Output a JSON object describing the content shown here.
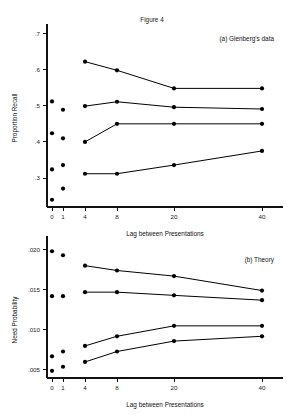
{
  "figure": {
    "title": "Figure 4",
    "xlabel": "Lag between Presentations"
  },
  "chart_data": [
    {
      "type": "line",
      "panel_label": "(a) Glenberg's data",
      "title": "Figure 4",
      "xlabel": "Lag between Presentations",
      "ylabel": "Proportion Recall",
      "x_ticklabels": [
        "0",
        "1",
        "4",
        "8",
        "20",
        "40"
      ],
      "x_values": [
        0,
        1,
        4,
        8,
        20,
        40
      ],
      "y_ticklabels": [
        ".3",
        ".4",
        ".5",
        ".6",
        ".7"
      ],
      "ylim": [
        0.22,
        0.715
      ],
      "grid": false,
      "legend": "none",
      "connected_x": [
        4,
        8,
        20,
        40
      ],
      "series": [
        {
          "name": "series-1-top",
          "values": [
            0.622,
            0.598,
            0.548,
            0.548
          ]
        },
        {
          "name": "series-2",
          "values": [
            0.499,
            0.511,
            0.496,
            0.491
          ]
        },
        {
          "name": "series-3",
          "values": [
            0.4,
            0.45,
            0.45,
            0.45
          ]
        },
        {
          "name": "series-4-bottom",
          "values": [
            0.312,
            0.312,
            0.336,
            0.375
          ]
        }
      ],
      "isolated_points": [
        {
          "x": 0,
          "values": [
            0.512,
            0.424,
            0.324,
            0.24
          ]
        },
        {
          "x": 1,
          "values": [
            0.489,
            0.41,
            0.336,
            0.271
          ]
        }
      ]
    },
    {
      "type": "line",
      "panel_label": "(b) Theory",
      "xlabel": "Lag between Presentations",
      "ylabel": "Need Probability",
      "x_ticklabels": [
        "0",
        "1",
        "4",
        "8",
        "20",
        "40"
      ],
      "x_values": [
        0,
        1,
        4,
        8,
        20,
        40
      ],
      "y_ticklabels": [
        ".005",
        ".010",
        ".015",
        ".020"
      ],
      "ylim": [
        0.004,
        0.0212
      ],
      "grid": false,
      "legend": "none",
      "connected_x": [
        4,
        8,
        20,
        40
      ],
      "series": [
        {
          "name": "series-1-top",
          "values": [
            0.018,
            0.0174,
            0.0167,
            0.0149
          ]
        },
        {
          "name": "series-2",
          "values": [
            0.0147,
            0.0147,
            0.0143,
            0.0137
          ]
        },
        {
          "name": "series-3",
          "values": [
            0.008,
            0.0092,
            0.0105,
            0.0105
          ]
        },
        {
          "name": "series-4-bottom",
          "values": [
            0.006,
            0.0073,
            0.0086,
            0.0092
          ]
        }
      ],
      "isolated_points": [
        {
          "x": 0,
          "values": [
            0.0198,
            0.0142,
            0.0067,
            0.0049
          ]
        },
        {
          "x": 1,
          "values": [
            0.0193,
            0.0142,
            0.0073,
            0.0054
          ]
        }
      ]
    }
  ]
}
